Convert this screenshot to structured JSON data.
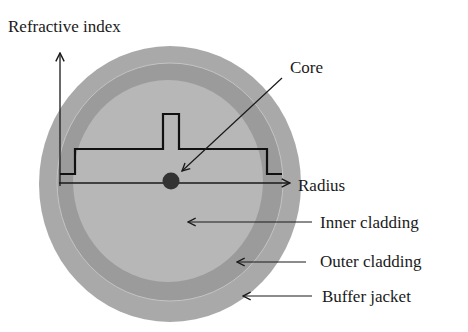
{
  "diagram": {
    "labels": {
      "y_axis": "Refractive index",
      "x_axis": "Radius",
      "core": "Core",
      "inner_cladding": "Inner cladding",
      "outer_cladding": "Outer cladding",
      "buffer_jacket": "Buffer jacket"
    },
    "colors": {
      "buffer_jacket": "#a8a8a8",
      "outer_cladding": "#9c9c9c",
      "inner_cladding": "#b6b6b6",
      "core": "#333333",
      "lines": "#1a1a1a"
    },
    "layers": [
      {
        "name": "Buffer jacket",
        "cx": 170,
        "cy": 184,
        "rx": 131,
        "ry": 138
      },
      {
        "name": "Outer cladding",
        "cx": 170,
        "cy": 182,
        "rx": 113,
        "ry": 119
      },
      {
        "name": "Inner cladding",
        "cx": 168,
        "cy": 181,
        "rx": 95,
        "ry": 101
      },
      {
        "name": "Core",
        "cx": 171,
        "cy": 181,
        "r": 8
      }
    ],
    "profile": {
      "description": "W-type step index profile: low, cladding level, core peak, cladding level, low",
      "levels": [
        "low",
        "cladding",
        "core",
        "cladding",
        "low"
      ]
    }
  }
}
